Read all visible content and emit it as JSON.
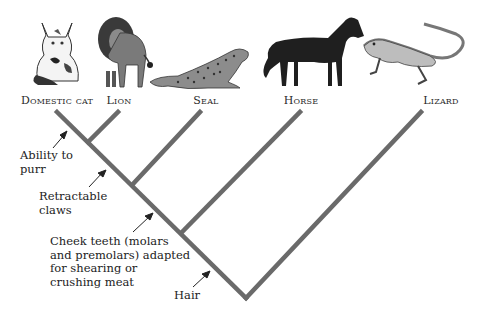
{
  "diagram": {
    "type": "cladogram",
    "taxa": [
      {
        "id": "cat",
        "label": "Domestic cat",
        "x": 57
      },
      {
        "id": "lion",
        "label": "Lion",
        "x": 119
      },
      {
        "id": "seal",
        "label": "Seal",
        "x": 206
      },
      {
        "id": "horse",
        "label": "Horse",
        "x": 301
      },
      {
        "id": "lizard",
        "label": "Lizard",
        "x": 441
      }
    ],
    "traits": [
      {
        "id": "purr",
        "lines": [
          "Ability to",
          "purr"
        ]
      },
      {
        "id": "claws",
        "lines": [
          "Retractable",
          "claws"
        ]
      },
      {
        "id": "teeth",
        "lines": [
          "Cheek teeth (molars",
          "and premolars) adapted",
          "for shearing or",
          "crushing meat"
        ]
      },
      {
        "id": "hair",
        "lines": [
          "Hair"
        ]
      }
    ],
    "colors": {
      "branch": "#6a6a6a",
      "arrow": "#222222",
      "text": "#222222"
    }
  }
}
